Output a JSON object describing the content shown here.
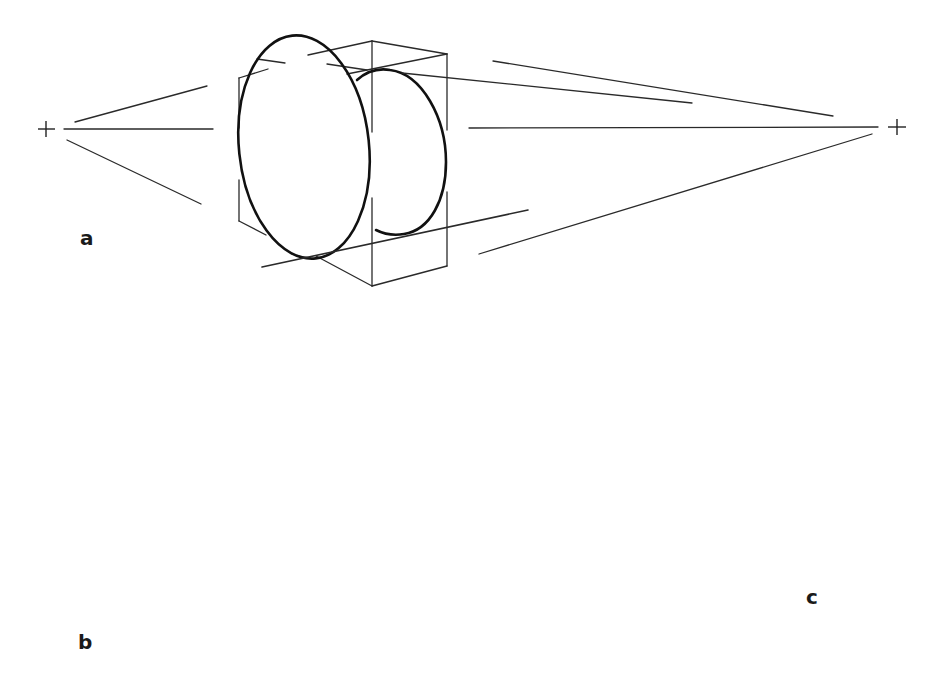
{
  "figure": {
    "colors": {
      "background": "#ffffff",
      "ink": "#111111"
    },
    "panels": [
      {
        "id": "a",
        "label": "a",
        "content": "Cylinder inscribed in a box with two vanishing points and construction lines"
      },
      {
        "id": "b",
        "label": "b",
        "content": "Foreshortened cylinder"
      },
      {
        "id": "c",
        "label": "c",
        "content": "Ring (tube) in perspective with construction lines and two centre marks"
      }
    ],
    "vanishing_points": [
      {
        "name": "left-vanishing-point",
        "symbol": "+"
      },
      {
        "name": "right-vanishing-point",
        "symbol": "+"
      }
    ]
  }
}
